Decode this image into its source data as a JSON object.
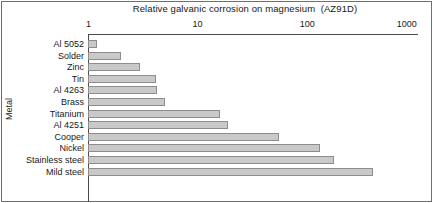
{
  "chart_data": {
    "type": "bar",
    "orientation": "horizontal",
    "title": "Relative galvanic corrosion on magnesium  (AZ91D)",
    "xlabel": "",
    "ylabel": "Metal",
    "xscale": "log",
    "xlim": [
      1,
      1000
    ],
    "xticks": [
      1,
      10,
      100,
      1000
    ],
    "xtick_labels": [
      "1",
      "10",
      "100",
      "1000"
    ],
    "grid": false,
    "legend": null,
    "categories": [
      "Al 5052",
      "Solder",
      "Zinc",
      "Tin",
      "Al 4263",
      "Brass",
      "Titanium",
      "Al 4251",
      "Cooper",
      "Nickel",
      "Stainless steel",
      "Mild steel"
    ],
    "values": [
      1.2,
      2.0,
      3.0,
      4.2,
      4.3,
      5.0,
      16,
      19,
      55,
      130,
      175,
      400
    ],
    "bar_color": "#c9c9c9",
    "bar_edge_color": "#8d8d8d",
    "axis_color": "#4a4a4a"
  }
}
